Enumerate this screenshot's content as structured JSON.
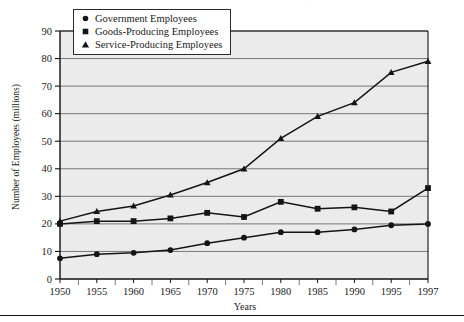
{
  "figure": {
    "title": "EMPLOYEES IN THREE MAJOR SECTORS, 1950-1997",
    "title_note": "clipped at top edge of image"
  },
  "axes": {
    "ylabel": "Number of Employees (millions)",
    "xlabel": "Years",
    "ytick_labels": [
      "0",
      "10",
      "20",
      "30",
      "40",
      "50",
      "60",
      "70",
      "80",
      "90"
    ],
    "xtick_labels": [
      "1950",
      "1955",
      "1960",
      "1965",
      "1970",
      "1975",
      "1980",
      "1985",
      "1990",
      "1995",
      "1997"
    ]
  },
  "legend": {
    "items": [
      {
        "label": "Government Employees",
        "marker": "circle",
        "color": "#141414"
      },
      {
        "label": "Goods-Producing Employees",
        "marker": "square",
        "color": "#141414"
      },
      {
        "label": "Service-Producing Employees",
        "marker": "triangle",
        "color": "#141414"
      }
    ]
  },
  "chart_data": {
    "type": "line",
    "title": "EMPLOYEES IN THREE MAJOR SECTORS, 1950-1997",
    "xlabel": "Years",
    "ylabel": "Number of Employees (millions)",
    "x": [
      1950,
      1955,
      1960,
      1965,
      1970,
      1975,
      1980,
      1985,
      1990,
      1995,
      1997
    ],
    "categories": [
      "1950",
      "1955",
      "1960",
      "1965",
      "1970",
      "1975",
      "1980",
      "1985",
      "1990",
      "1995",
      "1997"
    ],
    "ylim": [
      0,
      90
    ],
    "ytick_step": 10,
    "grid": "horizontal",
    "legend_position": "top-left-inside",
    "series": [
      {
        "name": "Government Employees",
        "marker": "circle",
        "color": "#141414",
        "values": [
          7.5,
          9,
          9.5,
          10.5,
          13,
          15,
          17,
          17,
          18,
          19.5,
          20
        ]
      },
      {
        "name": "Goods-Producing Employees",
        "marker": "square",
        "color": "#141414",
        "values": [
          20,
          21,
          21,
          22,
          24,
          22.5,
          28,
          25.5,
          26,
          24.5,
          33
        ]
      },
      {
        "name": "Service-Producing Employees",
        "marker": "triangle",
        "color": "#141414",
        "values": [
          21,
          24.5,
          26.5,
          30.5,
          35,
          40,
          51,
          59,
          64,
          75,
          79
        ]
      }
    ]
  },
  "colors": {
    "plot_background": "#ebebeb",
    "gridline": "#6a6a6a",
    "axis": "#111111",
    "ink": "#141414"
  }
}
